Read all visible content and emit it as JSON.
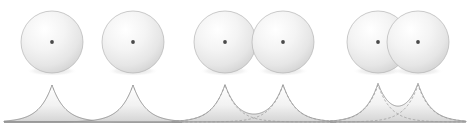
{
  "figure": {
    "width": 470,
    "height": 131,
    "background_color": "#ffffff",
    "panel_count": 3
  },
  "style": {
    "sphere_fill_light": "#fdfdfd",
    "sphere_fill_mid": "#e9e9e9",
    "sphere_fill_edge": "#c9c9c9",
    "sphere_outline_color": "#b5b5b5",
    "nucleus_color": "#4a4a4a",
    "curve_stroke_color": "#8a8a8a",
    "curve_dash_color": "#9a9a9a",
    "curve_fill_top": "#ffffff",
    "curve_fill_bottom": "#d8d8d8",
    "baseline_color": "#9b9b9b",
    "shadow_color": "#e0e0e0"
  },
  "panels": [
    {
      "id": "panel-separated",
      "label": "Large separation",
      "overlap_state": "no overlap",
      "sphere_radius": 31,
      "spheres": [
        {
          "name": "sphere-left",
          "cx": 52,
          "cy": 42,
          "nucleus_x": 52,
          "nucleus_y": 42
        },
        {
          "name": "sphere-right",
          "cx": 133,
          "cy": 42,
          "nucleus_x": 133,
          "nucleus_y": 42
        }
      ],
      "nucleus_separation": 81,
      "baseline": {
        "x_start": 4,
        "x_end": 182,
        "y": 122
      },
      "curves": [
        {
          "name": "density-curve-left",
          "center_x": 52,
          "peak_y": 85,
          "decay": 13,
          "dashed": false
        },
        {
          "name": "density-curve-right",
          "center_x": 133,
          "peak_y": 85,
          "decay": 13,
          "dashed": false
        }
      ],
      "has_sum_envelope": false
    },
    {
      "id": "panel-tangent",
      "label": "Touching spheres",
      "overlap_state": "tangent / slight overlap",
      "sphere_radius": 31,
      "spheres": [
        {
          "name": "sphere-left",
          "cx": 225,
          "cy": 42,
          "nucleus_x": 225,
          "nucleus_y": 42
        },
        {
          "name": "sphere-right",
          "cx": 283,
          "cy": 42,
          "nucleus_x": 283,
          "nucleus_y": 42
        }
      ],
      "nucleus_separation": 58,
      "baseline": {
        "x_start": 172,
        "x_end": 336,
        "y": 122
      },
      "curves": [
        {
          "name": "density-curve-left",
          "center_x": 225,
          "peak_y": 85,
          "decay": 13,
          "dashed": true
        },
        {
          "name": "density-curve-right",
          "center_x": 283,
          "peak_y": 85,
          "decay": 13,
          "dashed": true
        }
      ],
      "has_sum_envelope": true
    },
    {
      "id": "panel-overlapping",
      "label": "Strong overlap",
      "overlap_state": "interpenetrating",
      "sphere_radius": 31,
      "spheres": [
        {
          "name": "sphere-left",
          "cx": 378,
          "cy": 42,
          "nucleus_x": 378,
          "nucleus_y": 42
        },
        {
          "name": "sphere-right",
          "cx": 418,
          "cy": 42,
          "nucleus_x": 418,
          "nucleus_y": 42
        }
      ],
      "nucleus_separation": 40,
      "baseline": {
        "x_start": 330,
        "x_end": 466,
        "y": 122
      },
      "curves": [
        {
          "name": "density-curve-left",
          "center_x": 378,
          "peak_y": 85,
          "decay": 13,
          "dashed": true
        },
        {
          "name": "density-curve-right",
          "center_x": 418,
          "peak_y": 85,
          "decay": 13,
          "dashed": true
        }
      ],
      "has_sum_envelope": true
    }
  ]
}
